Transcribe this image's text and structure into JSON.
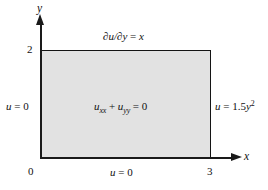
{
  "figure": {
    "type": "boundary-value-problem-diagram",
    "axes": {
      "x_axis_label": "x",
      "y_axis_label": "y",
      "x_ticks": [
        "0",
        "3"
      ],
      "y_ticks": [
        "2"
      ],
      "origin_label": "0",
      "x_max_label": "3",
      "y_max_label": "2"
    },
    "domain": {
      "x_range": [
        0,
        3
      ],
      "y_range": [
        0,
        2
      ],
      "fill_color": "#e2e2e2",
      "border_color": "#141414"
    },
    "pde": {
      "u": "u",
      "sub_xx": "xx",
      "plus": " + ",
      "u2": "u",
      "sub_yy": "yy",
      "equals_zero": " = 0"
    },
    "boundary_conditions": {
      "top": {
        "partial": "∂",
        "u": "u",
        "slash": "/",
        "partial2": "∂",
        "y": "y",
        "equals": " = ",
        "rhs": "x"
      },
      "left": {
        "u": "u",
        "equals": " = 0"
      },
      "right": {
        "u": "u",
        "equals": " = 1.5",
        "y": "y",
        "exponent": "2"
      },
      "bottom": {
        "u": "u",
        "equals": " = 0"
      }
    }
  }
}
